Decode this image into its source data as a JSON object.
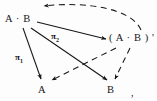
{
  "figure": {
    "kind": "commutative-diagram",
    "background_color": "#fdfdfd",
    "ink_color": "#16161a"
  },
  "nodes": [
    {
      "id": "ab",
      "label": "A · B",
      "x": 20,
      "y": 19
    },
    {
      "id": "ab_prime",
      "label": "( A · B ) '",
      "x": 130,
      "y": 38
    },
    {
      "id": "a",
      "label": "A",
      "x": 42,
      "y": 90
    },
    {
      "id": "b",
      "label": "B",
      "x": 111,
      "y": 90
    }
  ],
  "arrow_labels": [
    {
      "id": "pi1",
      "base": "π",
      "sub": "1",
      "x": 19,
      "y": 58
    },
    {
      "id": "pi2",
      "base": "π",
      "sub": "2",
      "x": 55,
      "y": 37
    }
  ],
  "edges": [
    {
      "id": "ab-to-ab-prime",
      "from": "ab",
      "to": "ab_prime",
      "style": "solid",
      "arrowhead": true
    },
    {
      "id": "ab-prime-to-ab",
      "from": "ab_prime",
      "to": "ab",
      "style": "dashed",
      "arrowhead": true,
      "curved": true
    },
    {
      "id": "ab-to-a",
      "from": "ab",
      "to": "a",
      "style": "solid",
      "arrowhead": true,
      "label": "pi1"
    },
    {
      "id": "ab-to-b",
      "from": "ab",
      "to": "b",
      "style": "solid",
      "arrowhead": true,
      "label": "pi2"
    },
    {
      "id": "ab-prime-to-a",
      "from": "ab_prime",
      "to": "a",
      "style": "dashed",
      "arrowhead": true
    },
    {
      "id": "ab-prime-to-b",
      "from": "ab_prime",
      "to": "b",
      "style": "dashed",
      "arrowhead": true
    }
  ],
  "punctuation": {
    "trailing_comma": ","
  }
}
